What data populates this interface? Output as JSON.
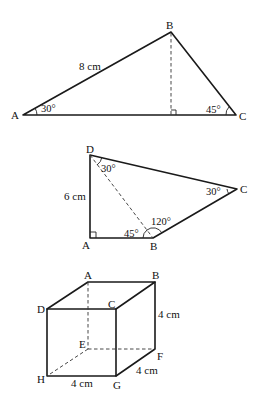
{
  "figure1": {
    "vertices": {
      "A": "A",
      "B": "B",
      "C": "C"
    },
    "side_label": "8 cm",
    "angle_A": "30°",
    "angle_C": "45°"
  },
  "figure2": {
    "vertices": {
      "A": "A",
      "B": "B",
      "C": "C",
      "D": "D"
    },
    "side_label": "6 cm",
    "angle_D": "30°",
    "angle_C": "30°",
    "angle_B_inner": "45°",
    "angle_B_outer": "120°"
  },
  "figure3": {
    "vertices": {
      "A": "A",
      "B": "B",
      "C": "C",
      "D": "D",
      "E": "E",
      "F": "F",
      "G": "G",
      "H": "H"
    },
    "edge_BF": "4 cm",
    "edge_GF": "4 cm",
    "edge_HG": "4 cm"
  }
}
